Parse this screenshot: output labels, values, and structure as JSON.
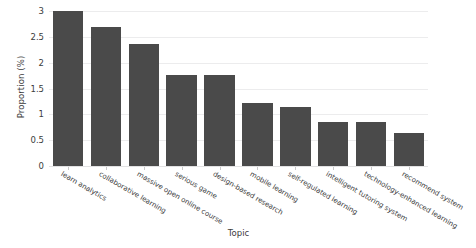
{
  "chart_data": {
    "type": "bar",
    "title": "",
    "xlabel": "Topic",
    "ylabel": "Proportion (%)",
    "ylim": [
      0,
      3
    ],
    "yticks": [
      "0",
      "0.5",
      "1",
      "1.5",
      "2",
      "2.5",
      "3"
    ],
    "ytick_values": [
      0,
      0.5,
      1,
      1.5,
      2,
      2.5,
      3
    ],
    "grid": true,
    "legend": "none",
    "bar_color": "#4a4a4a",
    "background_color": "#ffffff",
    "gridline_color": "#ececed",
    "categories": [
      "learn analytics",
      "collaborative learning",
      "massive open online course",
      "serious game",
      "design-based research",
      "mobile learning",
      "self-regulated learning",
      "intelligent tutoring system",
      "technology-enhanced learning",
      "recommend system"
    ],
    "values": [
      3.0,
      2.7,
      2.37,
      1.77,
      1.77,
      1.22,
      1.15,
      0.85,
      0.85,
      0.63
    ]
  }
}
